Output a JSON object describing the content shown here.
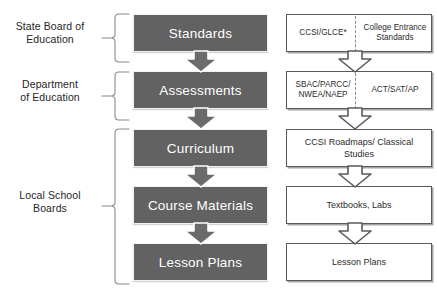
{
  "diagram": {
    "colors": {
      "process_fill": "#626262",
      "process_text": "#ffffff",
      "box_border": "#5a5a5a",
      "box_fill": "#ffffff",
      "brace": "#8a8a8a",
      "divider": "#8a8a8a"
    },
    "governance_labels": [
      {
        "id": "state-board",
        "line1": "State Board of",
        "line2": "Education"
      },
      {
        "id": "dept-education",
        "line1": "Department",
        "line2": "of Education"
      },
      {
        "id": "local-school-boards",
        "line1": "Local School",
        "line2": "Boards"
      }
    ],
    "process_boxes": [
      {
        "id": "standards",
        "label": "Standards"
      },
      {
        "id": "assessments",
        "label": "Assessments"
      },
      {
        "id": "curriculum",
        "label": "Curriculum"
      },
      {
        "id": "course-materials",
        "label": "Course Materials"
      },
      {
        "id": "lesson-plans",
        "label": "Lesson Plans"
      }
    ],
    "example_boxes": [
      {
        "id": "standards-examples",
        "split": true,
        "left": "CCSI/GLCE*",
        "right": "College Entrance Standards"
      },
      {
        "id": "assessments-examples",
        "split": true,
        "left": "SBAC/PARCC/ NWEA/NAEP",
        "right": "ACT/SAT/AP"
      },
      {
        "id": "curriculum-examples",
        "split": false,
        "label": "CCSI Roadmaps/ Classical Studies"
      },
      {
        "id": "course-materials-examples",
        "split": false,
        "label": "Textbooks, Labs"
      },
      {
        "id": "lesson-plans-examples",
        "split": false,
        "label": "Lesson Plans"
      }
    ]
  }
}
